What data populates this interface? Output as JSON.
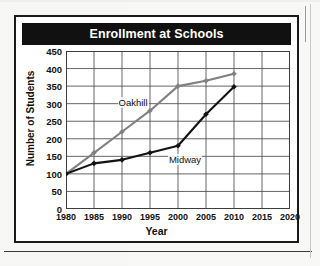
{
  "figure": {
    "title": "Enrollment at Schools",
    "title_color": "#ffffff",
    "title_bar_color": "#111111"
  },
  "axes": {
    "y_title": "Number of Students",
    "x_title": "Year"
  },
  "chart_data": {
    "type": "line",
    "title": "Enrollment at Schools",
    "xlabel": "Year",
    "ylabel": "Number of Students",
    "x": [
      1980,
      1985,
      1990,
      1995,
      2000,
      2005,
      2010,
      2015,
      2020
    ],
    "xticks": [
      "1980",
      "1985",
      "1990",
      "1995",
      "2000",
      "2005",
      "2010",
      "2015",
      "2020"
    ],
    "yticks": [
      "0",
      "50",
      "100",
      "150",
      "200",
      "250",
      "300",
      "350",
      "400",
      "450"
    ],
    "xlim": [
      1980,
      2020
    ],
    "ylim": [
      0,
      450
    ],
    "grid": true,
    "legend": "inline-labels",
    "series": [
      {
        "name": "Oakhill",
        "color": "#808080",
        "marker": "diamond",
        "x": [
          1980,
          1985,
          1990,
          1995,
          2000,
          2005,
          2010
        ],
        "values": [
          100,
          160,
          220,
          280,
          350,
          365,
          385
        ]
      },
      {
        "name": "Midway",
        "color": "#121212",
        "marker": "diamond",
        "x": [
          1980,
          1985,
          1990,
          1995,
          2000,
          2005,
          2010
        ],
        "values": [
          100,
          130,
          140,
          160,
          180,
          270,
          348
        ]
      }
    ],
    "annotations": [
      {
        "text": "Oakhill",
        "x": 1989.2,
        "y": 302
      },
      {
        "text": "Midway",
        "x": 1998.2,
        "y": 140
      }
    ]
  }
}
